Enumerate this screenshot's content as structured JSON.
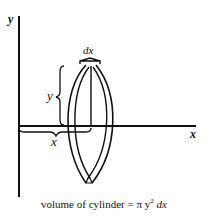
{
  "diagram": {
    "axes": {
      "y_label": "y",
      "x_label": "x"
    },
    "labels": {
      "width": "dx",
      "height": "y",
      "distance": "x"
    },
    "caption": {
      "prefix": "volume of cylinder = π y",
      "exponent": "2",
      "suffix": " dx"
    },
    "colors": {
      "ink": "#111111",
      "background": "#ffffff"
    }
  }
}
